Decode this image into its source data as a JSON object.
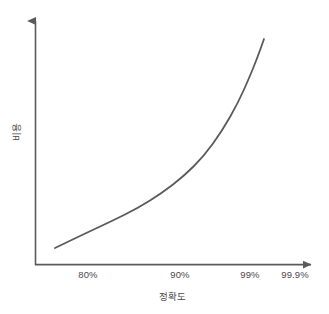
{
  "chart_data": {
    "type": "line",
    "title": "",
    "subtitle": "",
    "xlabel": "정확도",
    "ylabel": "비용",
    "grid": false,
    "legend": false,
    "legend_position": "none",
    "annotations": [],
    "x_tick_labels": [
      "80%",
      "90%",
      "99%",
      "99.9%"
    ],
    "x_tick_positions_px": [
      88,
      180,
      250,
      295
    ],
    "y_tick_labels": [],
    "xlim_labels": [
      "80%",
      "99.9%"
    ],
    "ylim": [
      0,
      100
    ],
    "axis_scale_note": "logit-like x axis; cost grows exponentially",
    "series": [
      {
        "name": "비용",
        "color": "#5a5a5a",
        "line_width_px": 1.8,
        "x": [
          "80%",
          "85%",
          "90%",
          "93%",
          "95%",
          "97%",
          "98%",
          "99%",
          "99.4%",
          "99.6%"
        ],
        "values": [
          8,
          14,
          22,
          29,
          37,
          49,
          60,
          76,
          90,
          100
        ],
        "points_px": [
          [
            55,
            248
          ],
          [
            84,
            234
          ],
          [
            112,
            221
          ],
          [
            138,
            208
          ],
          [
            162,
            193
          ],
          [
            184,
            176
          ],
          [
            204,
            156
          ],
          [
            222,
            131
          ],
          [
            238,
            103
          ],
          [
            250,
            76
          ],
          [
            258,
            56
          ],
          [
            264,
            39
          ]
        ]
      }
    ]
  },
  "axes": {
    "origin_px": [
      35,
      265
    ],
    "y_axis_top_px": [
      35,
      12
    ],
    "x_axis_right_px": [
      320,
      265
    ],
    "color": "#5a5a5a",
    "line_width_px": 1.6,
    "arrowheads": true,
    "ticks_visible": false
  },
  "colors": {
    "background": "#ffffff",
    "axis": "#5a5a5a",
    "curve": "#5a5a5a",
    "text": "#4a4a4a"
  }
}
